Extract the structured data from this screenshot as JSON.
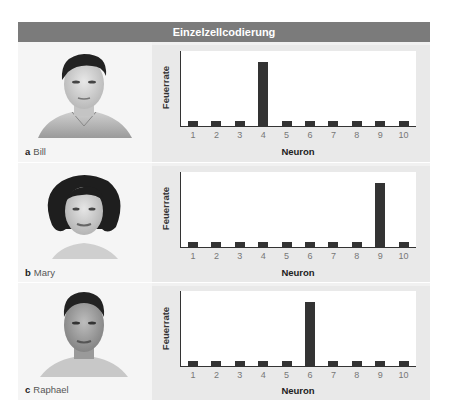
{
  "title": "Einzelzellcodierung",
  "colors": {
    "header_bg": "#7b7b7b",
    "bar": "#333333",
    "panel_left": "#f5f5f5",
    "panel_right": "#e9e9e9"
  },
  "rows": [
    {
      "letter": "a",
      "name": "Bill",
      "ylabel": "Feuerrate",
      "xlabel": "Neuron",
      "icon": "bill-face-icon"
    },
    {
      "letter": "b",
      "name": "Mary",
      "ylabel": "Feuerrate",
      "xlabel": "Neuron",
      "icon": "mary-face-icon"
    },
    {
      "letter": "c",
      "name": "Raphael",
      "ylabel": "Feuerrate",
      "xlabel": "Neuron",
      "icon": "raphael-face-icon"
    }
  ],
  "ticks": [
    "1",
    "2",
    "3",
    "4",
    "5",
    "6",
    "7",
    "8",
    "9",
    "10"
  ],
  "chart_data": [
    {
      "type": "bar",
      "title": "Bill",
      "categories": [
        "1",
        "2",
        "3",
        "4",
        "5",
        "6",
        "7",
        "8",
        "9",
        "10"
      ],
      "values": [
        0.08,
        0.08,
        0.08,
        1.0,
        0.08,
        0.08,
        0.08,
        0.08,
        0.08,
        0.08
      ],
      "xlabel": "Neuron",
      "ylabel": "Feuerrate",
      "ylim": [
        0,
        1.1
      ],
      "grid": false
    },
    {
      "type": "bar",
      "title": "Mary",
      "categories": [
        "1",
        "2",
        "3",
        "4",
        "5",
        "6",
        "7",
        "8",
        "9",
        "10"
      ],
      "values": [
        0.08,
        0.08,
        0.08,
        0.08,
        0.08,
        0.08,
        0.08,
        0.08,
        1.0,
        0.08
      ],
      "xlabel": "Neuron",
      "ylabel": "Feuerrate",
      "ylim": [
        0,
        1.1
      ],
      "grid": false
    },
    {
      "type": "bar",
      "title": "Raphael",
      "categories": [
        "1",
        "2",
        "3",
        "4",
        "5",
        "6",
        "7",
        "8",
        "9",
        "10"
      ],
      "values": [
        0.08,
        0.08,
        0.08,
        0.08,
        0.08,
        1.0,
        0.08,
        0.08,
        0.08,
        0.08
      ],
      "xlabel": "Neuron",
      "ylabel": "Feuerrate",
      "ylim": [
        0,
        1.1
      ],
      "grid": false
    }
  ]
}
